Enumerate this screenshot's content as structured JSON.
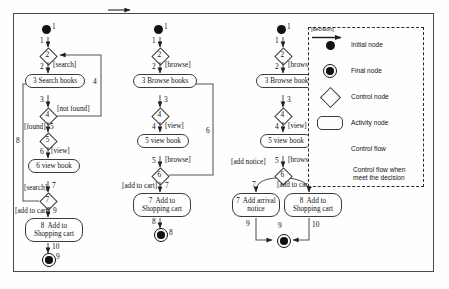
{
  "diagram": {
    "frame": {
      "border_color": "#4a4a4a",
      "background": "#fefefe"
    }
  },
  "columns": [
    {
      "id": "col1",
      "name": "search-flow",
      "nodes": [
        {
          "id": "c1n1",
          "type": "initial",
          "label": "1"
        },
        {
          "id": "c1n2",
          "type": "control",
          "label": "2"
        },
        {
          "id": "c1n3",
          "type": "activity",
          "label": "3",
          "text": "Search books"
        },
        {
          "id": "c1n4",
          "type": "control",
          "label": "4"
        },
        {
          "id": "c1n5",
          "type": "control",
          "label": "5"
        },
        {
          "id": "c1n6",
          "type": "activity",
          "label": "6",
          "text": "view book"
        },
        {
          "id": "c1n7",
          "type": "control",
          "label": "7"
        },
        {
          "id": "c1n8",
          "type": "activity",
          "label": "8",
          "text": "Add to Shopping cart"
        },
        {
          "id": "c1n9",
          "type": "final",
          "label": "9"
        }
      ],
      "edges": [
        {
          "id": "c1e1",
          "num": "1",
          "guard": ""
        },
        {
          "id": "c1e2",
          "num": "2",
          "guard": "[search]"
        },
        {
          "id": "c1e3",
          "num": "3",
          "guard": ""
        },
        {
          "id": "c1e4",
          "num": "4",
          "guard": "[not found]"
        },
        {
          "id": "c1e5",
          "num": "5",
          "guard": "[found]"
        },
        {
          "id": "c1e6",
          "num": "6",
          "guard": "[view]"
        },
        {
          "id": "c1e7",
          "num": "7",
          "guard": ""
        },
        {
          "id": "c1e8",
          "num": "8",
          "guard": "[search]"
        },
        {
          "id": "c1e9",
          "num": "9",
          "guard": "[add to cart]"
        },
        {
          "id": "c1e10",
          "num": "10",
          "guard": ""
        }
      ]
    },
    {
      "id": "col2",
      "name": "browse-flow",
      "nodes": [
        {
          "id": "c2n1",
          "type": "initial",
          "label": "1"
        },
        {
          "id": "c2n2",
          "type": "control",
          "label": "2"
        },
        {
          "id": "c2n3",
          "type": "activity",
          "label": "3",
          "text": "Browse books"
        },
        {
          "id": "c2n4",
          "type": "control",
          "label": "4"
        },
        {
          "id": "c2n5",
          "type": "activity",
          "label": "5",
          "text": "view book"
        },
        {
          "id": "c2n6",
          "type": "control",
          "label": "6"
        },
        {
          "id": "c2n7",
          "type": "activity",
          "label": "7",
          "text": "Add to Shopping cart"
        },
        {
          "id": "c2n8",
          "type": "final",
          "label": "8"
        }
      ],
      "edges": [
        {
          "id": "c2e1",
          "num": "1",
          "guard": ""
        },
        {
          "id": "c2e2",
          "num": "2",
          "guard": "[browse]"
        },
        {
          "id": "c2e3",
          "num": "3",
          "guard": ""
        },
        {
          "id": "c2e4",
          "num": "4",
          "guard": "[view]"
        },
        {
          "id": "c2e5",
          "num": "5",
          "guard": "[browse]"
        },
        {
          "id": "c2e6",
          "num": "6",
          "guard": ""
        },
        {
          "id": "c2e7",
          "num": "7",
          "guard": "[add to cart]"
        },
        {
          "id": "c2e8",
          "num": "8",
          "guard": ""
        }
      ]
    },
    {
      "id": "col3",
      "name": "browse-notice-flow",
      "nodes": [
        {
          "id": "c3n1",
          "type": "initial",
          "label": "1"
        },
        {
          "id": "c3n2",
          "type": "control",
          "label": "2"
        },
        {
          "id": "c3n3",
          "type": "activity",
          "label": "3",
          "text": "Browse books"
        },
        {
          "id": "c3n4",
          "type": "control",
          "label": "4"
        },
        {
          "id": "c3n5",
          "type": "activity",
          "label": "5",
          "text": "view book"
        },
        {
          "id": "c3n6",
          "type": "control",
          "label": "6"
        },
        {
          "id": "c3n7",
          "type": "activity",
          "label": "7",
          "text": "Add arrival notice"
        },
        {
          "id": "c3n8",
          "type": "activity",
          "label": "8",
          "text": "Add to Shopping cart"
        },
        {
          "id": "c3n9",
          "type": "final",
          "label": "9"
        }
      ],
      "edges": [
        {
          "id": "c3e1",
          "num": "1",
          "guard": ""
        },
        {
          "id": "c3e2",
          "num": "2",
          "guard": "[browse]"
        },
        {
          "id": "c3e3",
          "num": "3",
          "guard": ""
        },
        {
          "id": "c3e4",
          "num": "4",
          "guard": "[view]"
        },
        {
          "id": "c3e5",
          "num": "5",
          "guard": "[browse]"
        },
        {
          "id": "c3e6",
          "num": "6",
          "guard": ""
        },
        {
          "id": "c3e7",
          "num": "7",
          "guard": "[add notice]"
        },
        {
          "id": "c3e8",
          "num": "8",
          "guard": "[add to cart]"
        },
        {
          "id": "c3e9",
          "num": "9",
          "guard": ""
        },
        {
          "id": "c3e10",
          "num": "10",
          "guard": ""
        }
      ]
    }
  ],
  "legend": {
    "name": "legend-box",
    "items": [
      {
        "symbol": "initial-node-symbol",
        "label": "Initial node"
      },
      {
        "symbol": "final-node-symbol",
        "label": "Final node"
      },
      {
        "symbol": "control-node-symbol",
        "label": "Control node"
      },
      {
        "symbol": "activity-node-symbol",
        "label": "Activity  node"
      },
      {
        "symbol": "control-flow-arrow",
        "label": "Control flow"
      },
      {
        "symbol": "decision-flow-arrow",
        "label": "Control flow when meet the decision",
        "line1": "Control flow when",
        "line2": "meet the decision",
        "guard": "[decision]"
      }
    ]
  }
}
